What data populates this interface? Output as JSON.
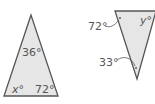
{
  "diagram": {
    "colors": {
      "fill": "#e6e6e6",
      "stroke": "#555555",
      "text": "#555555"
    },
    "triangle_left": {
      "angle_top": "36°",
      "angle_bottom_left_var": "x",
      "angle_bottom_left_deg": "°",
      "angle_bottom_right": "72°"
    },
    "triangle_right": {
      "angle_top_left": "72°",
      "angle_top_right_var": "y",
      "angle_top_right_deg": "°",
      "angle_bottom": "33°"
    }
  }
}
